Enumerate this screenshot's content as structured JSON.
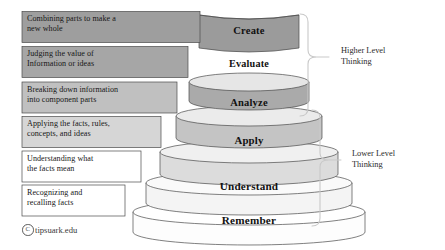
{
  "diagram": {
    "credit": {
      "symbol": "C",
      "text": "tipsuark.edu"
    },
    "brackets": [
      {
        "id": "higher",
        "label": "Higher Level\nThinking"
      },
      {
        "id": "lower",
        "label": "Lower Level\nThinking"
      }
    ],
    "tiers": [
      {
        "id": "create",
        "name": "Create",
        "description": "Combining parts to make a\nnew whole",
        "fill": "#9e9e9e",
        "top_fill": "#b8b8b8",
        "box_fill": "#9e9e9e",
        "name_size": "10.5px"
      },
      {
        "id": "evaluate",
        "name": "Evaluate",
        "description": "Judging the value of\nInformation or ideas",
        "fill": "#a8a8a8",
        "top_fill": "#e8e8e8",
        "box_fill": "#a6a6a6",
        "name_size": "10.2px"
      },
      {
        "id": "analyze",
        "name": "Analyze",
        "description": "Breaking down information\ninto component parts",
        "fill": "#c2c2c2",
        "top_fill": "#ededed",
        "box_fill": "#c0c0c0",
        "name_size": "10.5px"
      },
      {
        "id": "apply",
        "name": "Apply",
        "description": "Applying the facts, rules,\nconcepts, and ideas",
        "fill": "#d8d8d8",
        "top_fill": "#f2f2f2",
        "box_fill": "#d6d6d6",
        "name_size": "10.8px"
      },
      {
        "id": "understand",
        "name": "Understand",
        "description": "Understanding what\nthe facts mean",
        "fill": "#ededed",
        "top_fill": "#f8f8f8",
        "box_fill": "#ffffff",
        "name_size": "11.2px"
      },
      {
        "id": "remember",
        "name": "Remember",
        "description": "Recognizing and\nrecalling facts",
        "fill": "#fbfbfb",
        "top_fill": "#ffffff",
        "box_fill": "#ffffff",
        "name_size": "11.2px"
      }
    ]
  }
}
